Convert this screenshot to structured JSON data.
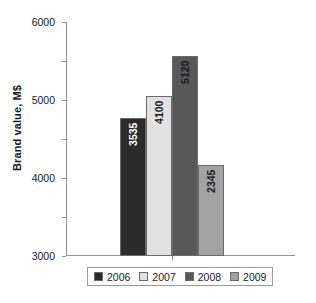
{
  "chart_data": {
    "type": "bar",
    "title": "",
    "subtitle": "",
    "xlabel": "",
    "ylabel": "Brand value, M$",
    "categories": [
      "2006",
      "2007",
      "2008",
      "2009"
    ],
    "values": [
      3535,
      4100,
      5120,
      2345
    ],
    "data_labels": [
      "3535",
      "4100",
      "5120",
      "2345"
    ],
    "ylim": [
      0,
      6000
    ],
    "ytick_labels": [
      "6000",
      "5000",
      "4000",
      "3000",
      "2000",
      "1000",
      "0"
    ],
    "ytick_values": [
      6000,
      5000,
      4000,
      3000,
      2000,
      1000,
      0
    ],
    "grid": false,
    "legend_position": "bottom",
    "series": [
      {
        "name": "2006",
        "value": 3535,
        "color": "#2b2b2b",
        "label_color": "#ffffff"
      },
      {
        "name": "2007",
        "value": 4100,
        "color": "#e2e2e2",
        "label_color": "#1a1a1a"
      },
      {
        "name": "2008",
        "value": 5120,
        "color": "#585858",
        "label_color": "#1a1a1a"
      },
      {
        "name": "2009",
        "value": 2345,
        "color": "#a3a3a3",
        "label_color": "#1a1a1a"
      }
    ],
    "axis_color": "#8f8f8f",
    "background_color": "#ffffff"
  },
  "legend": {
    "entries": [
      {
        "label": "2006"
      },
      {
        "label": "2007"
      },
      {
        "label": "2008"
      },
      {
        "label": "2009"
      }
    ]
  }
}
